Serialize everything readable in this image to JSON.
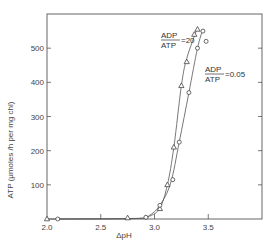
{
  "chart_data": {
    "type": "line",
    "title": "",
    "xlabel": "ΔpH",
    "ylabel": "ATP (μmoles /h per mg chl)",
    "xlim": [
      2.0,
      4.0
    ],
    "ylim": [
      0,
      600
    ],
    "x_ticks": [
      2.0,
      2.5,
      3.0,
      3.5
    ],
    "x_tick_labels": [
      "2.0",
      "2.5",
      "3.0",
      "3.5"
    ],
    "y_ticks": [
      100,
      200,
      300,
      400,
      500
    ],
    "y_tick_labels": [
      "100",
      "200",
      "300",
      "400",
      "500"
    ],
    "grid": false,
    "legend": null,
    "series": [
      {
        "name": "ADP/ATP = 20",
        "marker": "triangle",
        "x": [
          2.0,
          2.75,
          3.05,
          3.12,
          3.18,
          3.25,
          3.3,
          3.37,
          3.4
        ],
        "y": [
          0,
          3,
          30,
          100,
          210,
          390,
          460,
          540,
          555
        ]
      },
      {
        "name": "ADP/ATP = 0.05",
        "marker": "circle",
        "x": [
          2.1,
          2.92,
          3.05,
          3.17,
          3.23,
          3.32,
          3.4,
          3.45,
          3.48
        ],
        "y": [
          0,
          5,
          40,
          115,
          225,
          370,
          500,
          550,
          520
        ]
      }
    ],
    "annotations": [
      {
        "numerator": "ADP",
        "denominator": "ATP",
        "value": "=20",
        "series": 0
      },
      {
        "numerator": "ADP",
        "denominator": "ATP",
        "value": "=0.05",
        "series": 1
      }
    ]
  }
}
